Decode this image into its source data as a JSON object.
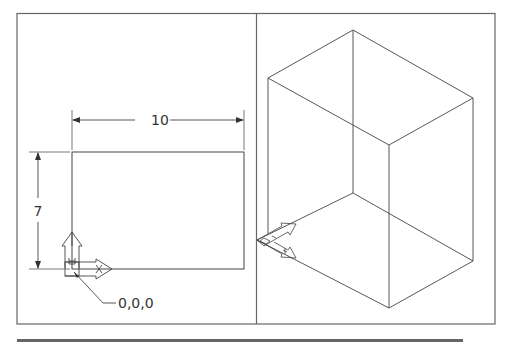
{
  "figure": {
    "left_viewport": {
      "label": "plan-view",
      "dimensions": {
        "horizontal": "10",
        "vertical": "7"
      },
      "origin_label": "0,0,0",
      "ucs_icon": {
        "x_axis": "X",
        "y_axis": "Y",
        "icon": "ucs-icon"
      }
    },
    "right_viewport": {
      "label": "isometric-view",
      "ucs_icon": {
        "icon": "ucs-iso-icon"
      }
    },
    "colors": {
      "line": "#444444",
      "frame": "#555555",
      "background": "#ffffff"
    }
  }
}
